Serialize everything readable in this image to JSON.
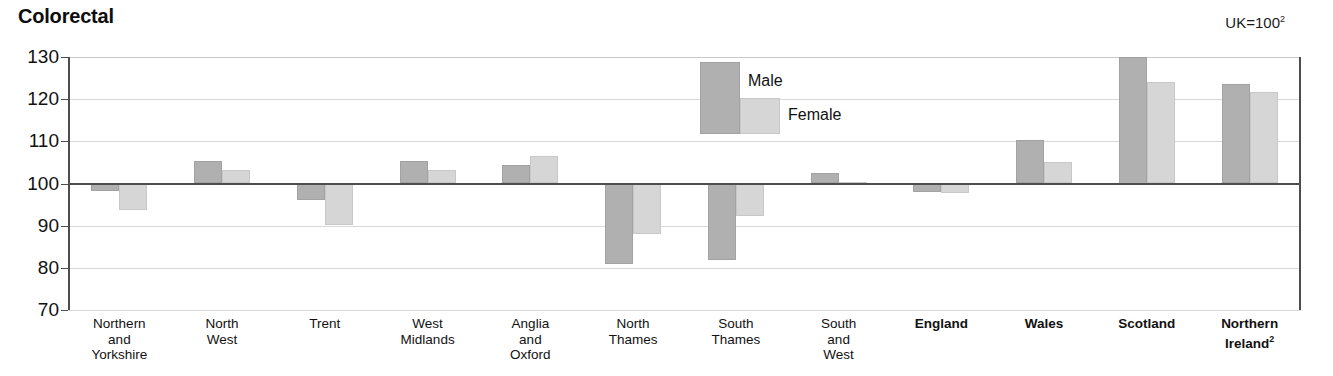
{
  "chart_data": {
    "type": "bar",
    "title": "Colorectal",
    "annotation": "UK=100",
    "annotation_superscript": "2",
    "xlabel": "",
    "ylabel": "",
    "ylim": [
      70,
      130
    ],
    "yticks": [
      130,
      120,
      110,
      100,
      90,
      80,
      70
    ],
    "baseline": 100,
    "grid": true,
    "legend_position": "inside-top-center",
    "categories": [
      "Northern\nand\nYorkshire",
      "North\nWest",
      "Trent",
      "West\nMidlands",
      "Anglia\nand\nOxford",
      "North\nThames",
      "South\nThames",
      "South\nand\nWest",
      "England",
      "Wales",
      "Scotland",
      "Northern\nIreland"
    ],
    "category_lines": [
      [
        "Northern",
        "and",
        "Yorkshire"
      ],
      [
        "North",
        "West"
      ],
      [
        "Trent"
      ],
      [
        "West",
        "Midlands"
      ],
      [
        "Anglia",
        "and",
        "Oxford"
      ],
      [
        "North",
        "Thames"
      ],
      [
        "South",
        "Thames"
      ],
      [
        "South",
        "and",
        "West"
      ],
      [
        "England"
      ],
      [
        "Wales"
      ],
      [
        "Scotland"
      ],
      [
        "Northern",
        "Ireland"
      ]
    ],
    "category_bold": [
      false,
      false,
      false,
      false,
      false,
      false,
      false,
      false,
      true,
      true,
      true,
      true
    ],
    "category_superscripts": [
      null,
      null,
      null,
      null,
      null,
      null,
      null,
      null,
      null,
      null,
      null,
      "2"
    ],
    "series": [
      {
        "name": "Male",
        "color": "#b0b0b0",
        "values": [
          98.3,
          105.3,
          96.0,
          105.4,
          104.3,
          80.8,
          81.8,
          102.5,
          98.0,
          110.3,
          130.0,
          123.7
        ]
      },
      {
        "name": "Female",
        "color": "#d6d6d6",
        "values": [
          93.6,
          103.2,
          90.2,
          103.3,
          106.5,
          88.0,
          92.3,
          100.4,
          97.7,
          105.1,
          124.0,
          121.8
        ]
      }
    ]
  },
  "legend": {
    "male_label": "Male",
    "female_label": "Female"
  },
  "yaxis": {
    "t0": "130",
    "t1": "120",
    "t2": "110",
    "t3": "100",
    "t4": "90",
    "t5": "80",
    "t6": "70"
  }
}
